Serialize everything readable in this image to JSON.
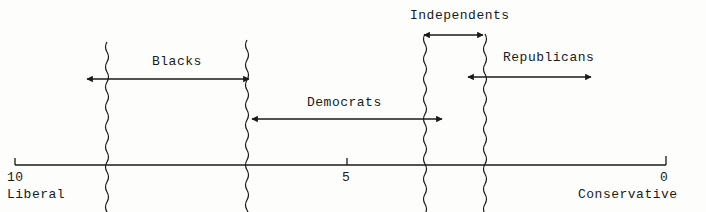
{
  "diagram": {
    "axis": {
      "ticks": [
        {
          "value": "10",
          "x": 15
        },
        {
          "value": "5",
          "x": 347
        },
        {
          "value": "0",
          "x": 666
        }
      ],
      "left_label": "Liberal",
      "right_label": "Conservative"
    },
    "groups": [
      {
        "name": "Blacks",
        "arrow_y": 79,
        "x_start": 85,
        "x_end": 250
      },
      {
        "name": "Democrats",
        "arrow_y": 119,
        "x_start": 251,
        "x_end": 443
      },
      {
        "name": "Independents",
        "arrow_y": 35,
        "x_start": 423,
        "x_end": 484
      },
      {
        "name": "Republicans",
        "arrow_y": 77,
        "x_start": 467,
        "x_end": 592
      }
    ],
    "boundaries_x": [
      107,
      247,
      425,
      485
    ],
    "line_color": "#1a1a1a"
  }
}
